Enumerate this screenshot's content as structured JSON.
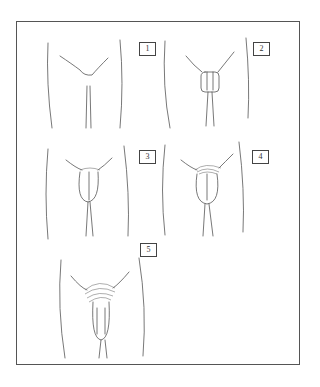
{
  "figure": {
    "type": "staged line illustration",
    "panel_count": 5,
    "panels": [
      {
        "label": "1",
        "stage": 1
      },
      {
        "label": "2",
        "stage": 2
      },
      {
        "label": "3",
        "stage": 3
      },
      {
        "label": "4",
        "stage": 4
      },
      {
        "label": "5",
        "stage": 5
      }
    ]
  },
  "colors": {
    "line": "#555555",
    "border": "#555555",
    "background": "#ffffff"
  }
}
